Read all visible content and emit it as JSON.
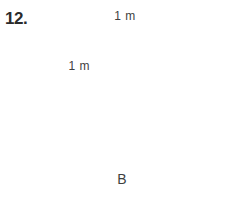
{
  "problem": {
    "number": "12."
  },
  "figure": {
    "label": "B",
    "shape_name": "polyomino-grid-figure",
    "dimensions": {
      "horizontal_label": "1 m",
      "vertical_label": "1 m"
    },
    "colors": {
      "line": "#6e6e6e",
      "dimension": "#3f3f3f",
      "text": "#3a3a3a",
      "background": "#ffffff"
    },
    "grid": {
      "origin_x": 68,
      "origin_y": 46,
      "cell_width": 37.5,
      "cell_height": 38,
      "columns": 5,
      "rows": 3,
      "filled_cells": [
        {
          "row": 0,
          "col": 1
        },
        {
          "row": 0,
          "col": 2
        },
        {
          "row": 1,
          "col": 1
        },
        {
          "row": 1,
          "col": 2
        },
        {
          "row": 1,
          "col": 3
        },
        {
          "row": 2,
          "col": 0
        },
        {
          "row": 2,
          "col": 1
        },
        {
          "row": 2,
          "col": 3
        },
        {
          "row": 2,
          "col": 4
        }
      ]
    }
  }
}
